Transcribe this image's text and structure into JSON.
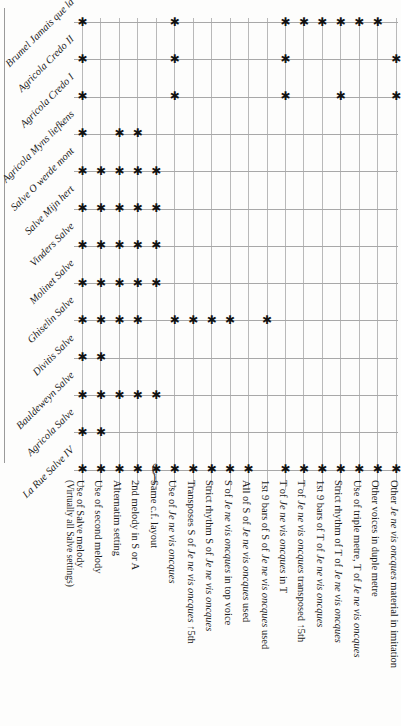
{
  "figure": {
    "type": "matrix-table",
    "marker_glyph": "✱",
    "parenthetical_marker_note": "(✱)",
    "grid_color": "#b9b9b9",
    "marker_color": "#121212"
  },
  "rows": [
    {
      "id": "brumel-jamais-que-la",
      "label": "Brumel Jamais que la"
    },
    {
      "id": "agricola-credo-ii",
      "label": "Agricola Credo II"
    },
    {
      "id": "agricola-credo-i",
      "label": "Agricola Credo I"
    },
    {
      "id": "agricola-myns-liefkens",
      "label": "Agricola Myns liefkens"
    },
    {
      "id": "salve-o-werde-mont",
      "label": "Salve O werde mont"
    },
    {
      "id": "salve-mijn-hert",
      "label": "Salve Mijn hert"
    },
    {
      "id": "vinders-salve",
      "label": "Vinders Salve"
    },
    {
      "id": "molinet-salve",
      "label": "Molinet Salve"
    },
    {
      "id": "ghiselin-salve",
      "label": "Ghiselin Salve"
    },
    {
      "id": "divitis-salve",
      "label": "Divitis Salve"
    },
    {
      "id": "bauldeweyn-salve",
      "label": "Bauldeweyn Salve"
    },
    {
      "id": "agricola-salve",
      "label": "Agricola Salve"
    },
    {
      "id": "la-rue-salve-iv",
      "label": "La Rue Salve IV"
    }
  ],
  "columns": [
    {
      "id": "use-of-salve-melody",
      "label": "Use of Salve melody",
      "sub": "(Virtually all Salve settings)"
    },
    {
      "id": "use-of-second-melody",
      "label": "Use of second melody",
      "sub": ""
    },
    {
      "id": "alternatim-setting",
      "label": "Alternatim setting",
      "sub": ""
    },
    {
      "id": "2nd-melody-in-s-or-a",
      "label": "2nd melody in S or A",
      "sub": ""
    },
    {
      "id": "same-cf-layout",
      "label": "Same c.f. layout",
      "sub": ""
    },
    {
      "id": "use-of-jnvo",
      "label": "Use of Je ne vis oncques",
      "sub": ""
    },
    {
      "id": "transposes-s-of-jnvo-5th",
      "label": "Transposes S of Je ne vis oncques ↑5th",
      "sub": ""
    },
    {
      "id": "strict-rhythm-s-of-jnvo",
      "label": "Strict rhythm S of Je ne vis oncques",
      "sub": ""
    },
    {
      "id": "s-of-jnvo-in-top-voice",
      "label": "S of Je ne vis oncques in top voice",
      "sub": ""
    },
    {
      "id": "all-of-s-of-jnvo-used",
      "label": "All of S of Je ne vis oncques used",
      "sub": ""
    },
    {
      "id": "first-9-bars-of-s-of-jnvo-used",
      "label": "1st 9 bars of S of Je ne vis oncques used",
      "sub": ""
    },
    {
      "id": "t-of-jnvo-in-t",
      "label": "T of Je ne vis oncques in T",
      "sub": ""
    },
    {
      "id": "t-of-jnvo-transposed-5th",
      "label": "T of Je ne vis oncques transposed ↑5th",
      "sub": ""
    },
    {
      "id": "first-9-bars-of-t-of-jnvo",
      "label": "1st 9 bars of T of Je ne vis oncques",
      "sub": ""
    },
    {
      "id": "strict-rhythm-of-t-of-jnvo",
      "label": "Strict rhythm of T of Je ne vis oncques",
      "sub": ""
    },
    {
      "id": "use-of-triple-metre-t-of-jnvo",
      "label": "Use of triple metre, T of Je ne vis oncques",
      "sub": ""
    },
    {
      "id": "other-voices-duple-metre",
      "label": "Other voices in duple metre",
      "sub": ""
    },
    {
      "id": "other-jnvo-material-imitation",
      "label": "Other Je ne vis oncques material in imitation",
      "sub": ""
    }
  ],
  "matrix": [
    {
      "row": "brumel-jamais-que-la",
      "marks": [
        1,
        0,
        0,
        0,
        0,
        1,
        0,
        0,
        0,
        0,
        0,
        1,
        1,
        1,
        1,
        1,
        1,
        0
      ]
    },
    {
      "row": "agricola-credo-ii",
      "marks": [
        1,
        0,
        0,
        0,
        0,
        1,
        0,
        0,
        0,
        0,
        0,
        1,
        0,
        0,
        0,
        0,
        0,
        1
      ]
    },
    {
      "row": "agricola-credo-i",
      "marks": [
        1,
        0,
        0,
        0,
        0,
        1,
        0,
        0,
        0,
        0,
        0,
        1,
        0,
        0,
        1,
        0,
        0,
        1
      ]
    },
    {
      "row": "agricola-myns-liefkens",
      "marks": [
        1,
        0,
        1,
        1,
        0,
        0,
        0,
        0,
        0,
        0,
        0,
        0,
        0,
        0,
        0,
        0,
        0,
        0
      ]
    },
    {
      "row": "salve-o-werde-mont",
      "marks": [
        1,
        1,
        1,
        1,
        1,
        0,
        0,
        0,
        0,
        0,
        0,
        0,
        0,
        0,
        0,
        0,
        0,
        0
      ]
    },
    {
      "row": "salve-mijn-hert",
      "marks": [
        1,
        1,
        1,
        1,
        1,
        0,
        0,
        0,
        0,
        0,
        0,
        0,
        0,
        0,
        0,
        0,
        0,
        0
      ]
    },
    {
      "row": "vinders-salve",
      "marks": [
        1,
        1,
        1,
        1,
        1,
        0,
        0,
        0,
        0,
        0,
        0,
        0,
        0,
        0,
        0,
        0,
        0,
        0
      ]
    },
    {
      "row": "molinet-salve",
      "marks": [
        1,
        1,
        1,
        1,
        1,
        0,
        0,
        0,
        0,
        0,
        0,
        0,
        0,
        0,
        0,
        0,
        0,
        0
      ]
    },
    {
      "row": "ghiselin-salve",
      "marks": [
        1,
        1,
        1,
        1,
        0,
        1,
        1,
        1,
        1,
        0,
        1,
        0,
        0,
        0,
        0,
        0,
        0,
        0
      ]
    },
    {
      "row": "divitis-salve",
      "marks": [
        1,
        1,
        0,
        0,
        0,
        0,
        0,
        0,
        0,
        0,
        0,
        0,
        0,
        0,
        0,
        0,
        0,
        0
      ]
    },
    {
      "row": "bauldeweyn-salve",
      "marks": [
        1,
        1,
        1,
        1,
        1,
        0,
        0,
        0,
        0,
        0,
        0,
        0,
        0,
        0,
        0,
        0,
        0,
        0
      ]
    },
    {
      "row": "agricola-salve",
      "marks": [
        1,
        1,
        0,
        0,
        0,
        0,
        0,
        0,
        0,
        0,
        0,
        0,
        0,
        0,
        0,
        0,
        0,
        0
      ]
    },
    {
      "row": "la-rue-salve-iv",
      "marks": [
        1,
        1,
        1,
        1,
        2,
        1,
        1,
        1,
        1,
        1,
        0,
        1,
        1,
        1,
        1,
        1,
        1,
        1
      ]
    }
  ]
}
